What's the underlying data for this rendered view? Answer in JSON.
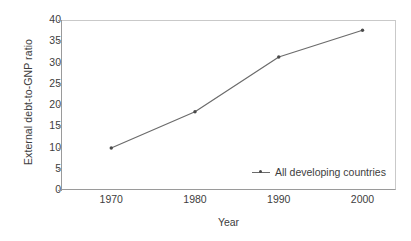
{
  "chart_data": {
    "type": "line",
    "title": "",
    "xlabel": "Year",
    "ylabel": "External debt-to-GNP ratio",
    "x": [
      1970,
      1980,
      1990,
      2000
    ],
    "xticklabels": [
      "1970",
      "1980",
      "1990",
      "2000"
    ],
    "yticks": [
      0,
      5,
      10,
      15,
      20,
      25,
      30,
      35,
      40
    ],
    "yticklabels": [
      "0",
      "5",
      "10",
      "15",
      "20",
      "25",
      "30",
      "35",
      "40"
    ],
    "xlim": [
      1964,
      2004
    ],
    "ylim": [
      0,
      40
    ],
    "grid": false,
    "legend_position": "inside-lower-right",
    "series": [
      {
        "name": "All developing countries",
        "values": [
          9.9,
          18.4,
          31.3,
          37.6
        ],
        "color": "#6b6b6b",
        "marker": "dot",
        "marker_color": "#4a4a4a"
      }
    ]
  },
  "colors": {
    "line": "#6b6b6b",
    "marker": "#4a4a4a",
    "axis": "#9a9a9a",
    "frame": "#c9c9c9",
    "text": "#3d3d3d",
    "background": "#ffffff"
  }
}
